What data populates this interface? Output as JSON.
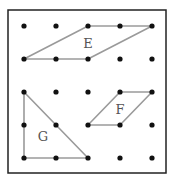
{
  "frame": {
    "x": 8,
    "y": 10,
    "width": 158,
    "height": 163,
    "stroke": "#222222"
  },
  "grid": {
    "xs": [
      24,
      56,
      88,
      120,
      152
    ],
    "ys": [
      26,
      59,
      92,
      125,
      158
    ],
    "dot_color": "#111111"
  },
  "shape_color": "#9a9a9a",
  "shapes": [
    {
      "label": "E",
      "type": "parallelogram",
      "vertices": [
        [
          24,
          59
        ],
        [
          88,
          26
        ],
        [
          152,
          26
        ],
        [
          88,
          59
        ]
      ],
      "points_on_edges": [
        [
          56,
          59
        ],
        [
          120,
          26
        ]
      ],
      "label_pos": [
        88,
        48
      ]
    },
    {
      "label": "F",
      "type": "parallelogram",
      "vertices": [
        [
          88,
          125
        ],
        [
          120,
          92
        ],
        [
          152,
          92
        ],
        [
          120,
          125
        ]
      ],
      "points_on_edges": [],
      "label_pos": [
        120,
        114
      ]
    },
    {
      "label": "G",
      "type": "right-triangle",
      "vertices": [
        [
          24,
          92
        ],
        [
          24,
          158
        ],
        [
          88,
          158
        ]
      ],
      "points_on_edges": [
        [
          24,
          125
        ],
        [
          56,
          158
        ],
        [
          56,
          125
        ]
      ],
      "label_pos": [
        43,
        141
      ]
    }
  ]
}
